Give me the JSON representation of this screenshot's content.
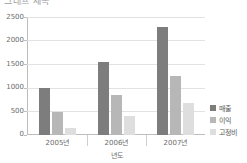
{
  "title_clipped": "그래프 제목",
  "chart_data": {
    "type": "bar",
    "title": "",
    "xlabel": "년도",
    "ylabel": "",
    "categories": [
      "2005년",
      "2006년",
      "2007년"
    ],
    "series": [
      {
        "name": "매출",
        "color": "#7d7d7d",
        "values": [
          1000,
          1550,
          2280
        ]
      },
      {
        "name": "이익",
        "color": "#b7b7b7",
        "values": [
          490,
          850,
          1250
        ]
      },
      {
        "name": "고정비",
        "color": "#dedede",
        "values": [
          140,
          400,
          670
        ]
      }
    ],
    "ylim": [
      0,
      2500
    ],
    "yticks": [
      0,
      500,
      1000,
      1500,
      2000,
      2500
    ],
    "ytick_labels": [
      "0",
      "500",
      "1000",
      "1500",
      "2000",
      "2500"
    ],
    "grid": true,
    "legend_position": "right"
  }
}
